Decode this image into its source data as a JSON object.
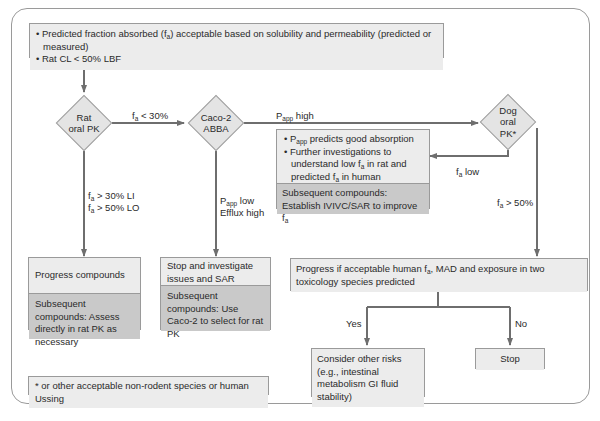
{
  "diagram": {
    "type": "flowchart",
    "start_box": {
      "bullets": [
        [
          "Predicted fraction absorbed (f",
          "a",
          ") acceptable based on solubility and permeability (predicted or measured)"
        ],
        [
          "Rat CL < 50% LBF"
        ]
      ]
    },
    "decisions": {
      "rat": {
        "line1": "Rat",
        "line2": "oral PK"
      },
      "caco": {
        "line1": "Caco-2",
        "line2": "ABBA"
      },
      "dog": {
        "line1": "Dog",
        "line2": "oral",
        "line3": "PK*"
      }
    },
    "edge_labels": {
      "fa_lt_30": {
        "pre": "f",
        "sub": "a",
        "post": " < 30%"
      },
      "papp_high": {
        "pre": "P",
        "sub": "app",
        "post": " high"
      },
      "fa_gt_30_li": {
        "pre": "f",
        "sub": "a",
        "post": " > 30% LI"
      },
      "fa_gt_50_lo": {
        "pre": "f",
        "sub": "a",
        "post": " > 50% LO"
      },
      "papp_low": {
        "pre": "P",
        "sub": "app",
        "post": " low"
      },
      "efflux_high": "Efflux high",
      "fa_low": {
        "pre": "f",
        "sub": "a",
        "post": " low"
      },
      "fa_gt_50": {
        "pre": "f",
        "sub": "a",
        "post": " > 50%"
      },
      "yes": "Yes",
      "no": "No"
    },
    "papp_box": {
      "bullet1": {
        "pre": "P",
        "sub": "app",
        "post": " predicts good absorption"
      },
      "bullet2": {
        "a": "Further investigations to understand low f",
        "sub1": "a",
        "b": " in rat and predicted f",
        "sub2": "a",
        "c": " in human"
      },
      "subsequent": {
        "line1": "Subsequent compounds:",
        "line2": "Establish IVIVC/SAR to improve f",
        "sub": "a"
      }
    },
    "progress_box": {
      "top": "Progress compounds",
      "bottom": "Subsequent compounds: Assess directly in rat PK as necessary"
    },
    "stop_investigate_box": {
      "top": "Stop and investigate issues and SAR",
      "bottom": "Subsequent compounds: Use Caco-2 to select for rat PK"
    },
    "progress_if_box": {
      "pre": "Progress if acceptable human f",
      "sub": "a",
      "post": ", MAD and exposure in two toxicology species predicted"
    },
    "consider_box": {
      "text": "Consider other risks (e.g., intestinal metabolism GI fluid stability)"
    },
    "stop_box": {
      "text": "Stop"
    },
    "footnote": {
      "text": "* or other acceptable non-rodent species or human Ussing"
    },
    "colors": {
      "box_light": "#ececec",
      "box_dark": "#c9c9c9",
      "diamond": "#e4e4e4",
      "line": "#6e6e6e",
      "border": "#9a9a9a"
    }
  }
}
